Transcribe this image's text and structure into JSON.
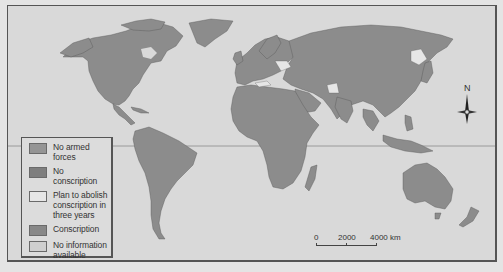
{
  "map": {
    "title": "World map: military service / conscription status",
    "background_color": "#d9d9d9",
    "land_color": "#8c8c8c",
    "border_color": "#555555",
    "equator_color": "#8a8a8a"
  },
  "legend": {
    "items": [
      {
        "label": "No armed forces",
        "color": "#959595"
      },
      {
        "label": "No conscription",
        "color": "#7e7e7e"
      },
      {
        "label": "Plan to abolish conscription in three years",
        "color": "#e6e6e6"
      },
      {
        "label": "Conscription",
        "color": "#888888"
      },
      {
        "label": "No information available",
        "color": "#cfcfcf"
      }
    ]
  },
  "scale_bar": {
    "labels": [
      "0",
      "2000",
      "4000 km"
    ]
  },
  "compass": {
    "north_label": "N",
    "icon": "compass-rose-icon"
  }
}
